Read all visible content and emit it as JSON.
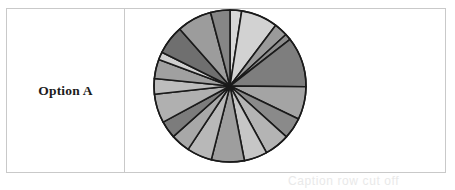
{
  "row": {
    "label": "Option A"
  },
  "caption": {
    "text": "Caption row cut off"
  },
  "colors": {
    "border": "#c9c9c9",
    "label_text": "#1c1c1c",
    "slice_stroke": "#1a1a1a",
    "background": "#ffffff"
  },
  "chart_data": {
    "type": "pie",
    "title": "",
    "xlabel": "",
    "ylabel": "",
    "legend": "none",
    "grid": false,
    "center": [
      104,
      81
    ],
    "radius": 76,
    "stroke_color": "#1a1a1a",
    "stroke_width": 1.6,
    "start_angle_deg": -90,
    "categories": [
      "s1",
      "s2",
      "s3",
      "s4",
      "s5",
      "s6",
      "s7",
      "s8",
      "s9",
      "s10",
      "s11",
      "s12",
      "s13",
      "s14",
      "s15",
      "s16",
      "s17",
      "s18",
      "s19",
      "s20"
    ],
    "values": [
      3.0,
      9.5,
      3.5,
      1.6,
      13.0,
      8.5,
      5.5,
      6.5,
      6.0,
      8.5,
      6.5,
      5.0,
      4.5,
      7.5,
      4.0,
      5.0,
      2.0,
      7.5,
      9.0,
      5.0
    ],
    "slice_colors": [
      "#d8d8d8",
      "#d2d2d2",
      "#9a9a9a",
      "#8c8c8c",
      "#7e7e7e",
      "#a4a4a4",
      "#8a8a8a",
      "#b4b4b4",
      "#c6c6c6",
      "#9e9e9e",
      "#b8b8b8",
      "#a8a8a8",
      "#7c7c7c",
      "#b0b0b0",
      "#bdbdbd",
      "#a0a0a0",
      "#cfcfcf",
      "#6f6f6f",
      "#9c9c9c",
      "#868686"
    ]
  }
}
